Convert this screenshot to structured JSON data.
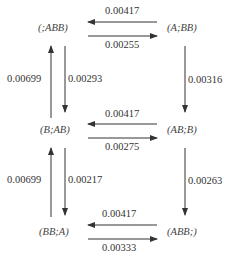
{
  "nodes": {
    "n_ABB_empty": "(;ABB)",
    "n_A_BB": "(A;BB)",
    "n_B_AB": "(B;AB)",
    "n_AB_B": "(AB;B)",
    "n_BB_A": "(BB;A)",
    "n_ABB_end": "(ABB;)"
  },
  "edges": {
    "top_left": "0.00417",
    "top_right": "0.00255",
    "mid_left": "0.00417",
    "mid_right": "0.00275",
    "bot_left": "0.00417",
    "bot_right": "0.00333",
    "left_up_1": "0.00699",
    "left_down_1": "0.00293",
    "left_up_2": "0.00699",
    "left_down_2": "0.00217",
    "right_down_1": "0.00316",
    "right_down_2": "0.00263"
  },
  "colors": {
    "line": "#333333",
    "text": "#333333"
  }
}
